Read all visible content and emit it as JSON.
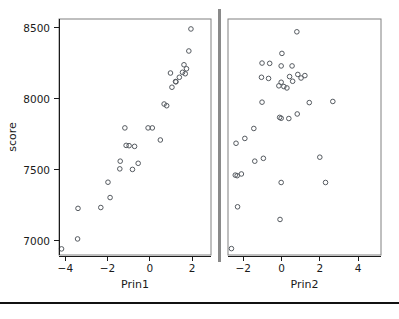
{
  "chart_data": {
    "type": "scatter",
    "title": "",
    "ylabel": "score",
    "ylim": [
      6900,
      8560
    ],
    "yticks": [
      7000,
      7500,
      8000,
      8500
    ],
    "ytick_labels": [
      "7000",
      "7500",
      "8000",
      "8500"
    ],
    "grid": false,
    "legend": null,
    "panels": [
      {
        "xlabel": "Prin1",
        "xlim": [
          -4.3,
          2.9
        ],
        "xticks": [
          -4,
          -2,
          0,
          2
        ],
        "xtick_labels": [
          "-4",
          "-2",
          "0",
          "2"
        ],
        "points": [
          {
            "x": -4.18,
            "y": 6943
          },
          {
            "x": -3.42,
            "y": 7013
          },
          {
            "x": -3.4,
            "y": 7228
          },
          {
            "x": -2.32,
            "y": 7234
          },
          {
            "x": -1.88,
            "y": 7304
          },
          {
            "x": -1.98,
            "y": 7412
          },
          {
            "x": -1.4,
            "y": 7560
          },
          {
            "x": -1.42,
            "y": 7506
          },
          {
            "x": -0.82,
            "y": 7502
          },
          {
            "x": -0.55,
            "y": 7545
          },
          {
            "x": -1.12,
            "y": 7671
          },
          {
            "x": -0.98,
            "y": 7669
          },
          {
            "x": -0.72,
            "y": 7664
          },
          {
            "x": -1.18,
            "y": 7794
          },
          {
            "x": -0.08,
            "y": 7794
          },
          {
            "x": 0.12,
            "y": 7794
          },
          {
            "x": 0.5,
            "y": 7709
          },
          {
            "x": 0.8,
            "y": 7950
          },
          {
            "x": 0.68,
            "y": 7962
          },
          {
            "x": 1.05,
            "y": 8080
          },
          {
            "x": 1.24,
            "y": 8118
          },
          {
            "x": 1.22,
            "y": 8120
          },
          {
            "x": 1.4,
            "y": 8150
          },
          {
            "x": 0.98,
            "y": 8180
          },
          {
            "x": 1.55,
            "y": 8185
          },
          {
            "x": 1.68,
            "y": 8175
          },
          {
            "x": 1.74,
            "y": 8210
          },
          {
            "x": 1.62,
            "y": 8238
          },
          {
            "x": 1.85,
            "y": 8335
          },
          {
            "x": 1.95,
            "y": 8490
          }
        ]
      },
      {
        "xlabel": "Prin2",
        "xlim": [
          -2.8,
          5.2
        ],
        "xticks": [
          -2,
          0,
          2,
          4
        ],
        "xtick_labels": [
          "-2",
          "0",
          "2",
          "4"
        ],
        "points": [
          {
            "x": -2.62,
            "y": 6945
          },
          {
            "x": -2.3,
            "y": 7239
          },
          {
            "x": -2.32,
            "y": 7458
          },
          {
            "x": -2.42,
            "y": 7462
          },
          {
            "x": -1.4,
            "y": 7560
          },
          {
            "x": -0.95,
            "y": 7580
          },
          {
            "x": -2.1,
            "y": 7470
          },
          {
            "x": -0.08,
            "y": 7150
          },
          {
            "x": -0.02,
            "y": 7410
          },
          {
            "x": 2.3,
            "y": 7410
          },
          {
            "x": 2.0,
            "y": 7588
          },
          {
            "x": -2.38,
            "y": 7686
          },
          {
            "x": -1.92,
            "y": 7720
          },
          {
            "x": -1.45,
            "y": 7790
          },
          {
            "x": -0.02,
            "y": 7862
          },
          {
            "x": -0.1,
            "y": 7868
          },
          {
            "x": 0.38,
            "y": 7860
          },
          {
            "x": 0.82,
            "y": 7892
          },
          {
            "x": 1.45,
            "y": 7972
          },
          {
            "x": 2.68,
            "y": 7980
          },
          {
            "x": -1.02,
            "y": 7975
          },
          {
            "x": -0.14,
            "y": 8090
          },
          {
            "x": 0.12,
            "y": 8085
          },
          {
            "x": 0.28,
            "y": 8075
          },
          {
            "x": -0.02,
            "y": 8115
          },
          {
            "x": -1.05,
            "y": 8150
          },
          {
            "x": -0.68,
            "y": 8142
          },
          {
            "x": 0.42,
            "y": 8155
          },
          {
            "x": 0.58,
            "y": 8122
          },
          {
            "x": 0.85,
            "y": 8170
          },
          {
            "x": 1.02,
            "y": 8145
          },
          {
            "x": 1.22,
            "y": 8162
          },
          {
            "x": -0.02,
            "y": 8230
          },
          {
            "x": 0.55,
            "y": 8230
          },
          {
            "x": -1.02,
            "y": 8250
          },
          {
            "x": -0.62,
            "y": 8248
          },
          {
            "x": 0.02,
            "y": 8318
          },
          {
            "x": 0.8,
            "y": 8470
          }
        ]
      }
    ]
  }
}
